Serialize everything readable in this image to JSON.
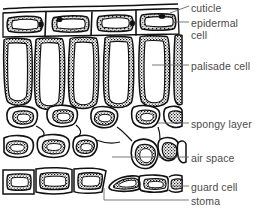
{
  "figure": {
    "background_color": "#ffffff",
    "ink_color": "#111111",
    "label_color": "#4a4a4a"
  },
  "labels": {
    "cuticle": "cuticle",
    "epidermal_cell_line1": "epidermal",
    "epidermal_cell_line2": "cell",
    "palisade_cell": "palisade cell",
    "spongy_layer": "spongy layer",
    "air_space": "air space",
    "guard_cell": "guard cell",
    "stoma": "stoma"
  },
  "diagram_structure": {
    "layers": [
      {
        "name": "cuticle",
        "description": "thin double line across top of leaf"
      },
      {
        "name": "upper epidermis",
        "cell_count": 4,
        "description": "row of flattened rectangular cells with oval vacuoles"
      },
      {
        "name": "palisade mesophyll",
        "cell_count": 5,
        "description": "tall narrow columnar cells packed with chloroplasts"
      },
      {
        "name": "spongy mesophyll",
        "cell_count": 11,
        "description": "irregular rounded cells with air spaces between"
      },
      {
        "name": "lower epidermis",
        "cell_count": 6,
        "description": "row of flattened cells including a pair of guard cells"
      },
      {
        "name": "stoma",
        "cell_count": 1,
        "description": "pore between two guard cells in lower epidermis"
      }
    ]
  }
}
